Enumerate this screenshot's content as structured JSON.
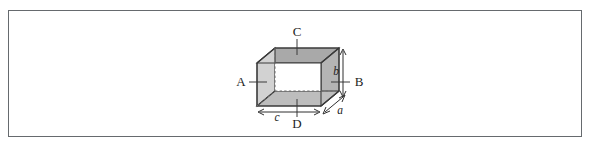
{
  "figure": {
    "caption": "",
    "panel": {
      "border_color": "#666a6e",
      "background_color": "#ffffff"
    },
    "shape": {
      "name": "open rectangular box",
      "faces": {
        "top_fill": "#a9a9a9",
        "left_fill": "#d2d2d2",
        "right_fill": "#b4b4b4",
        "bottom_inner_fill": "#bdbdbd",
        "interior_fill": "#ffffff"
      }
    },
    "face_labels": [
      {
        "id": "A",
        "text": "A",
        "position": "left"
      },
      {
        "id": "B",
        "text": "B",
        "position": "right"
      },
      {
        "id": "C",
        "text": "C",
        "position": "top"
      },
      {
        "id": "D",
        "text": "D",
        "position": "bottom"
      }
    ],
    "dimension_labels": [
      {
        "id": "a",
        "text": "a",
        "position": "depth"
      },
      {
        "id": "b",
        "text": "b",
        "position": "height"
      },
      {
        "id": "c",
        "text": "c",
        "position": "width"
      }
    ]
  }
}
